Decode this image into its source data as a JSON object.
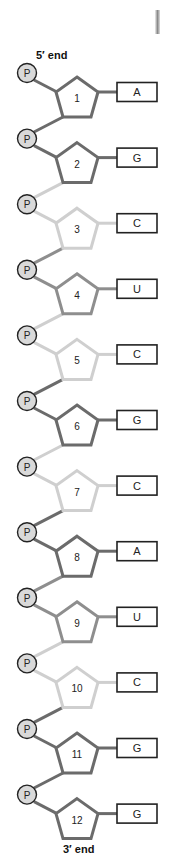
{
  "labels": {
    "five_prime": "5′ end",
    "three_prime": "3′ end",
    "phosphate": "P"
  },
  "colors": {
    "dark": "#6b6b6b",
    "medium": "#8e8e8e",
    "light": "#cfcfcf",
    "phosphate_fill": "#d9d9d9",
    "phosphate_stroke": "#222222",
    "box_stroke": "#222222"
  },
  "nucleotides": [
    {
      "number": "1",
      "base": "A",
      "sugar_shade": "dark",
      "link_in": "dark",
      "link_out": "dark"
    },
    {
      "number": "2",
      "base": "G",
      "sugar_shade": "dark",
      "link_in": "dark",
      "link_out": "light"
    },
    {
      "number": "3",
      "base": "C",
      "sugar_shade": "light",
      "link_in": "light",
      "link_out": "medium"
    },
    {
      "number": "4",
      "base": "U",
      "sugar_shade": "medium",
      "link_in": "medium",
      "link_out": "light"
    },
    {
      "number": "5",
      "base": "C",
      "sugar_shade": "light",
      "link_in": "light",
      "link_out": "dark"
    },
    {
      "number": "6",
      "base": "G",
      "sugar_shade": "dark",
      "link_in": "dark",
      "link_out": "light"
    },
    {
      "number": "7",
      "base": "C",
      "sugar_shade": "light",
      "link_in": "light",
      "link_out": "dark"
    },
    {
      "number": "8",
      "base": "A",
      "sugar_shade": "dark",
      "link_in": "dark",
      "link_out": "medium"
    },
    {
      "number": "9",
      "base": "U",
      "sugar_shade": "medium",
      "link_in": "medium",
      "link_out": "light"
    },
    {
      "number": "10",
      "base": "C",
      "sugar_shade": "light",
      "link_in": "light",
      "link_out": "dark"
    },
    {
      "number": "11",
      "base": "G",
      "sugar_shade": "dark",
      "link_in": "dark",
      "link_out": "dark"
    },
    {
      "number": "12",
      "base": "G",
      "sugar_shade": "dark",
      "link_in": "dark",
      "link_out": null
    }
  ]
}
